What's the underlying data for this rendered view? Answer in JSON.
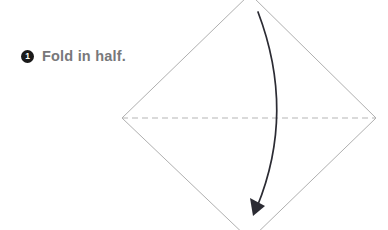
{
  "page": {
    "width": 388,
    "height": 230,
    "background_color": "#ffffff"
  },
  "instruction": {
    "step_number": "1",
    "badge_icon": "filled-circle-number-badge",
    "badge_color": "#1a1a1a",
    "badge_text_color": "#ffffff",
    "text": "Fold in half.",
    "text_color": "#78787a"
  },
  "diagram": {
    "name": "square-paper-diamond-orientation",
    "paper": {
      "shape": "diamond",
      "stroke_color": "#9a9a9a",
      "stroke_width": 0.8,
      "fill": "none",
      "vertices": [
        {
          "name": "top",
          "x": 250,
          "y": -6
        },
        {
          "name": "right",
          "x": 376,
          "y": 118
        },
        {
          "name": "bottom",
          "x": 250,
          "y": 240
        },
        {
          "name": "left",
          "x": 122,
          "y": 118
        }
      ]
    },
    "fold_line": {
      "name": "horizontal-valley-fold-line",
      "style": "dashed",
      "stroke_color": "#b5b5b5",
      "stroke_width": 1,
      "dash_pattern": "6 4",
      "from": {
        "x": 122,
        "y": 118
      },
      "to": {
        "x": 376,
        "y": 118
      }
    },
    "fold_arrow": {
      "name": "fold-direction-arrow",
      "style": "curved",
      "direction": "top-to-bottom",
      "stroke_color": "#2b2b33",
      "stroke_width": 1.7,
      "start": {
        "x": 258,
        "y": 12
      },
      "control": {
        "x": 296,
        "y": 112
      },
      "end": {
        "x": 257,
        "y": 207
      },
      "arrowhead": {
        "name": "solid-triangle-arrowhead",
        "tip": {
          "x": 253,
          "y": 216
        },
        "fill": "#2b2b33"
      }
    }
  }
}
